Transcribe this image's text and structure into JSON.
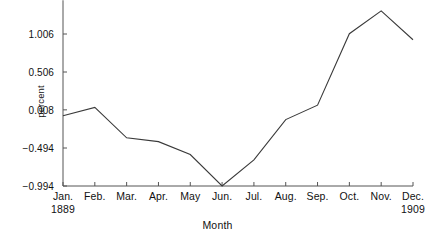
{
  "chart_data": {
    "type": "line",
    "title": "",
    "xlabel": "Month",
    "ylabel": "percent",
    "categories": [
      "Jan. 1889",
      "Feb.",
      "Mar.",
      "Apr.",
      "May",
      "Jun.",
      "Jul.",
      "Aug.",
      "Sep.",
      "Oct.",
      "Nov.",
      "Dec. 1909"
    ],
    "x_tick_labels": [
      "Jan.",
      "Feb.",
      "Mar.",
      "Apr.",
      "May",
      "Jun.",
      "Jul.",
      "Aug.",
      "Sep.",
      "Oct.",
      "Nov.",
      "Dec."
    ],
    "x_tick_sublabels": [
      "1889",
      "",
      "",
      "",
      "",
      "",
      "",
      "",
      "",
      "",
      "",
      "1909"
    ],
    "values": [
      -0.07,
      0.04,
      -0.36,
      -0.41,
      -0.58,
      -0.994,
      -0.65,
      -0.12,
      0.07,
      1.01,
      1.31,
      0.93
    ],
    "y_tick_values": [
      1.006,
      0.506,
      0.008,
      -0.494,
      -0.994
    ],
    "y_tick_labels": [
      "1.006",
      "0.506",
      "0.008",
      "−0.494",
      "−0.994"
    ],
    "ylim": [
      -0.994,
      1.45
    ],
    "xlim": [
      0,
      11
    ],
    "grid": false,
    "legend": false,
    "line_color": "#3a3a3a",
    "axis_color": "#555555",
    "background_color": "#ffffff"
  },
  "plot_geometry": {
    "left": 63,
    "right": 413,
    "top_value_y": 34,
    "bottom_value_y": 186
  }
}
